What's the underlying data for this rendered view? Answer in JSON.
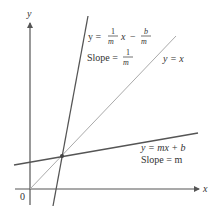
{
  "diagram": {
    "type": "coordinate-plot",
    "axes": {
      "x_label": "x",
      "y_label": "y",
      "origin_label": "0"
    },
    "lines": [
      {
        "name": "y = mx + b",
        "equation_label": "y = mx + b",
        "slope_label": "Slope = m",
        "color": "#555555"
      },
      {
        "name": "y = (1/m)x - b/m",
        "equation_prefix": "y =",
        "frac1_num": "1",
        "frac1_den": "m",
        "var_x": "x",
        "minus": "−",
        "frac2_num": "b",
        "frac2_den": "m",
        "slope_prefix": "Slope =",
        "slope_num": "1",
        "slope_den": "m",
        "color": "#555555"
      },
      {
        "name": "y = x",
        "equation_label": "y = x",
        "color": "#aaaaaa"
      }
    ],
    "intersection_point": {
      "description": "intersection of y = mx + b, its inverse, and y = x"
    },
    "colors": {
      "axis": "#555555",
      "line": "#555555",
      "identity_line": "#aaaaaa",
      "text": "#333333"
    }
  }
}
